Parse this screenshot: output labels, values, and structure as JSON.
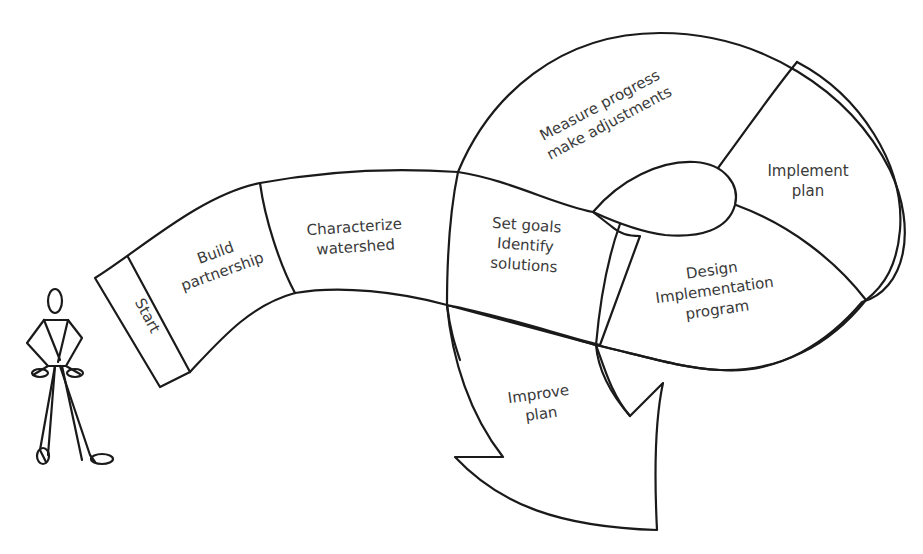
{
  "diagram": {
    "type": "process-path",
    "line_color": "#1a1a1a",
    "text_color": "#3a3a3a",
    "background": "#ffffff",
    "figure": {
      "name": "stick-figure",
      "label": ""
    },
    "steps": [
      {
        "id": "start",
        "lines": [
          "Start"
        ]
      },
      {
        "id": "build-partnership",
        "lines": [
          "Build",
          "partnership"
        ]
      },
      {
        "id": "characterize-watershed",
        "lines": [
          "Characterize",
          "watershed"
        ]
      },
      {
        "id": "set-goals",
        "lines": [
          "Set goals",
          "Identify",
          "solutions"
        ]
      },
      {
        "id": "design-program",
        "lines": [
          "Design",
          "Implementation",
          "program"
        ]
      },
      {
        "id": "implement-plan",
        "lines": [
          "Implement",
          "plan"
        ]
      },
      {
        "id": "measure-progress",
        "lines": [
          "Measure progress",
          "make adjustments"
        ]
      },
      {
        "id": "improve-plan",
        "lines": [
          "Improve",
          "plan"
        ]
      }
    ]
  }
}
